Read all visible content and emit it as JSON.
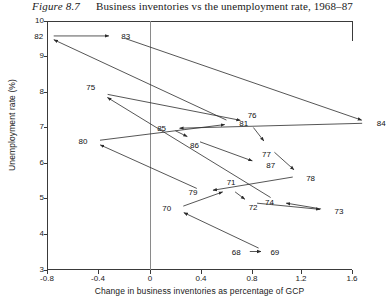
{
  "figure": {
    "number": "Figure 8.7",
    "title": "Business inventories vs the unemployment rate, 1968–87"
  },
  "chart_data": {
    "type": "scatter",
    "title": "Business inventories vs the unemployment rate, 1968–87",
    "subtitle": "Figure 8.7",
    "xlabel": "Change in business inventories as percentage of GCP",
    "ylabel": "Unemployment rate (%)",
    "xlim": [
      -0.9,
      1.75
    ],
    "ylim": [
      3.0,
      10.0
    ],
    "xticks": [
      "-0.8",
      "-0.4",
      "0",
      "0.4",
      "0.8",
      "1.2",
      "1.6"
    ],
    "xtick_values": [
      -0.8,
      -0.4,
      0,
      0.4,
      0.8,
      1.2,
      1.6
    ],
    "yticks": [
      "3",
      "4",
      "5",
      "6",
      "7",
      "8",
      "9",
      "10"
    ],
    "ytick_values": [
      3,
      4,
      5,
      6,
      7,
      8,
      9,
      10
    ],
    "grid": false,
    "legend": null,
    "zero_reference_line_x": 0,
    "connected": true,
    "point_label_field": "label",
    "points": [
      {
        "label": "68",
        "x": 0.74,
        "y": 3.52
      },
      {
        "label": "69",
        "x": 0.9,
        "y": 3.52
      },
      {
        "label": "70",
        "x": 0.2,
        "y": 4.72
      },
      {
        "label": "71",
        "x": 0.63,
        "y": 5.28
      },
      {
        "label": "72",
        "x": 0.77,
        "y": 4.9
      },
      {
        "label": "73",
        "x": 1.39,
        "y": 4.68
      },
      {
        "label": "74",
        "x": 0.99,
        "y": 4.92
      },
      {
        "label": "75",
        "x": -0.39,
        "y": 7.98
      },
      {
        "label": "76",
        "x": 0.77,
        "y": 7.16
      },
      {
        "label": "77",
        "x": 0.92,
        "y": 6.46
      },
      {
        "label": "78",
        "x": 1.17,
        "y": 5.65
      },
      {
        "label": "79",
        "x": 0.42,
        "y": 5.2
      },
      {
        "label": "80",
        "x": -0.45,
        "y": 6.62
      },
      {
        "label": "81",
        "x": 0.65,
        "y": 7.12
      },
      {
        "label": "82",
        "x": -0.81,
        "y": 9.58
      },
      {
        "label": "83",
        "x": -0.25,
        "y": 9.58
      },
      {
        "label": "84",
        "x": 1.71,
        "y": 7.13
      },
      {
        "label": "85",
        "x": 0.16,
        "y": 6.98
      },
      {
        "label": "86",
        "x": 0.33,
        "y": 6.68
      },
      {
        "label": "87",
        "x": 0.86,
        "y": 5.98
      }
    ],
    "path_order": [
      "68",
      "69",
      "70",
      "71",
      "72",
      "73",
      "74",
      "75",
      "76",
      "77",
      "78",
      "79",
      "80",
      "81",
      "82",
      "83",
      "84",
      "85",
      "86",
      "87"
    ]
  }
}
